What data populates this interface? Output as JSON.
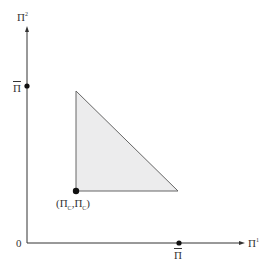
{
  "diagram": {
    "axes": {
      "x_label": "Π",
      "x_label_sup": "1",
      "y_label": "Π",
      "y_label_sup": "2",
      "origin_label": "0"
    },
    "points": {
      "y_intercept_label": "Π",
      "x_intercept_label": "Π",
      "corner_label_open": "(Π",
      "corner_label_sub1": "C",
      "corner_label_mid": ",Π",
      "corner_label_sub2": "C",
      "corner_label_close": ")"
    },
    "colors": {
      "region_fill": "#ececed",
      "line": "#555555",
      "point": "#111111"
    }
  }
}
